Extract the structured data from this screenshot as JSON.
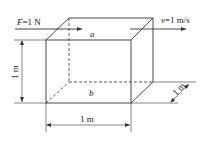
{
  "diagram": {
    "type": "physics-box-sketch",
    "force_label": {
      "symbol": "F",
      "equals": "=1 N"
    },
    "velocity_label": {
      "symbol": "v",
      "equals": "=1 m/s"
    },
    "top_plate_label": "a",
    "bottom_plate_label": "b",
    "dimensions": {
      "height": "1 m",
      "width": "1 m",
      "depth": "1 m"
    },
    "colors": {
      "line": "#333333",
      "text": "#222222",
      "background": "#ffffff"
    }
  }
}
